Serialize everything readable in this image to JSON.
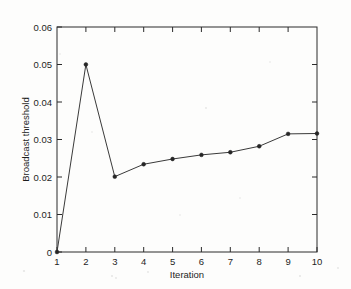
{
  "chart_data": {
    "type": "line",
    "title": "",
    "subtitle": "",
    "xlabel": "Iteration",
    "ylabel": "Broadcast threshold",
    "x": [
      1,
      2,
      3,
      4,
      5,
      6,
      7,
      8,
      9,
      10
    ],
    "values": [
      0,
      0.05,
      0.0201,
      0.0234,
      0.0248,
      0.0259,
      0.0266,
      0.0282,
      0.0315,
      0.0316
    ],
    "series": [
      {
        "name": "Broadcast threshold",
        "values": [
          0,
          0.05,
          0.0201,
          0.0234,
          0.0248,
          0.0259,
          0.0266,
          0.0282,
          0.0315,
          0.0316
        ]
      }
    ],
    "xlim": [
      1,
      10
    ],
    "ylim": [
      0,
      0.06
    ],
    "xticks": [
      1,
      2,
      3,
      4,
      5,
      6,
      7,
      8,
      9,
      10
    ],
    "xticklabels": [
      "1",
      "2",
      "3",
      "4",
      "5",
      "6",
      "7",
      "8",
      "9",
      "10"
    ],
    "yticks": [
      0,
      0.01,
      0.02,
      0.03,
      0.04,
      0.05,
      0.06
    ],
    "yticklabels": [
      "0",
      "0.01",
      "0.02",
      "0.03",
      "0.04",
      "0.05",
      "0.06"
    ],
    "grid": false,
    "legend": null,
    "legend_position": "none",
    "annotations": [],
    "marker": "dot",
    "line_color": "#3a3a3a",
    "marker_color": "#262626",
    "axis_color": "#2b2b2b",
    "background_color": "#fdfdfc",
    "box_frame": true,
    "tick_direction": "in"
  }
}
